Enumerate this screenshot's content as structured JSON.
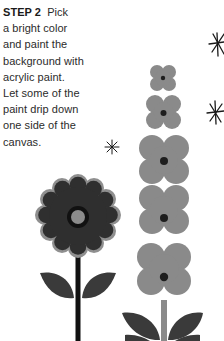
{
  "instructions": {
    "step_label": "STEP 2",
    "lines": [
      "Pick",
      "a bright color",
      "and paint the",
      "background with",
      "acrylic paint.",
      "Let some of the",
      "paint drip down",
      "one side of the",
      "canvas."
    ]
  },
  "illustration": {
    "colors": {
      "background": "#ffffff",
      "text": "#2b2b2b",
      "gray_petal": "#8a8a8a",
      "dark_petal": "#2f2f2f",
      "petal_outline": "#8f8f8f",
      "flower_center": "#1e1e1e",
      "center_fill": "#8c8c8c",
      "stem_black": "#111111",
      "stem_gray": "#8a8a8a",
      "leaf": "#3a3a3a",
      "star": "#1a1a1a"
    },
    "elements": [
      "sparkle-star-top-right",
      "sparkle-star-mid-right",
      "sparkle-star-center",
      "tall-gray-flower-stalk",
      "dark-daisy-flower"
    ]
  }
}
